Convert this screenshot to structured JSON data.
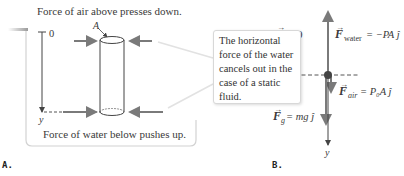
{
  "panelA": {
    "label": "A.",
    "top_caption": "Force of air above presses down.",
    "bottom_caption": "Force of water below pushes up.",
    "axis_zero": "0",
    "axis_y": "y",
    "area_label": "A",
    "callout_text": "The horizontal force of the water cancels out in the case of a static fluid."
  },
  "panelB": {
    "label": "B.",
    "accel_eq": "a = 0",
    "f_water": {
      "symbol": "F",
      "sub": "water",
      "rhs": "= −PA ĵ"
    },
    "f_air": {
      "symbol": "F",
      "sub": "air",
      "rhs": "= P₀A ĵ"
    },
    "f_g": {
      "symbol": "F",
      "sub": "g",
      "rhs": "= mg ĵ"
    },
    "axis_y": "y"
  },
  "colors": {
    "arrow": "#777777",
    "line": "#444444",
    "frame": "#cfcfcf",
    "dot": "#444444"
  }
}
